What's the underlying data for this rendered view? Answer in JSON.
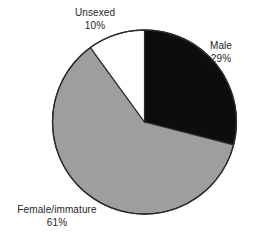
{
  "chart_data": {
    "type": "pie",
    "title": "",
    "subtitle": "",
    "xlabel": "",
    "ylabel": "",
    "legend_position": "none",
    "grid": false,
    "labels_inline": true,
    "unit": "%",
    "categories": [
      "Male",
      "Female/immature",
      "Unsexed"
    ],
    "values": [
      29,
      61,
      10
    ],
    "total": 100,
    "slices": [
      {
        "name": "Male",
        "value": 29,
        "value_text": "29%",
        "color": "#0d0d0d",
        "start_angle_deg": 0,
        "end_angle_deg": 104.4
      },
      {
        "name": "Female/immature",
        "value": 61,
        "value_text": "61%",
        "color": "#9e9e9e",
        "start_angle_deg": 104.4,
        "end_angle_deg": 324.0
      },
      {
        "name": "Unsexed",
        "value": 10,
        "value_text": "10%",
        "color": "#ffffff",
        "start_angle_deg": 324.0,
        "end_angle_deg": 360.0
      }
    ]
  },
  "figure": {
    "background": "#ffffff",
    "outline_color": "#2b2b2b",
    "text_color": "#262626",
    "center_x": 144.5,
    "center_y": 122,
    "radius": 92
  },
  "labels": {
    "male": {
      "name": "Male",
      "pct": "29%"
    },
    "female": {
      "name": "Female/immature",
      "pct": "61%"
    },
    "unsexed": {
      "name": "Unsexed",
      "pct": "10%"
    }
  }
}
